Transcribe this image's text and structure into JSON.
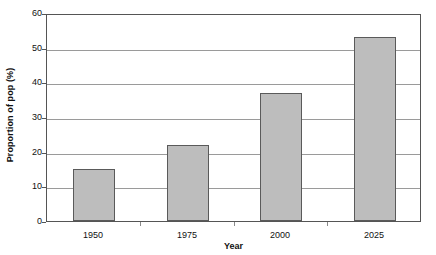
{
  "chart_data": {
    "type": "bar",
    "title": "",
    "categories": [
      "1950",
      "1975",
      "2000",
      "2025"
    ],
    "values": [
      15,
      22,
      37,
      53
    ],
    "series": [
      {
        "name": "Proportion of pop (%)",
        "values": [
          15,
          22,
          37,
          53
        ]
      }
    ],
    "xlabel": "Year",
    "ylabel": "Proportion of pop (%)",
    "ylim": [
      0,
      60
    ],
    "ytick_labels": [
      "0",
      "10",
      "20",
      "30",
      "40",
      "50",
      "60"
    ],
    "ytick_values": [
      0,
      10,
      20,
      30,
      40,
      50,
      60
    ],
    "grid": "horizontal",
    "legend": "none",
    "bar_fill_color": "#bdbdbd",
    "bar_edge_color": "#5a5a5a",
    "gridline_color": "#9a9a9a",
    "axis_color": "#555555",
    "background_color": "#ffffff"
  }
}
